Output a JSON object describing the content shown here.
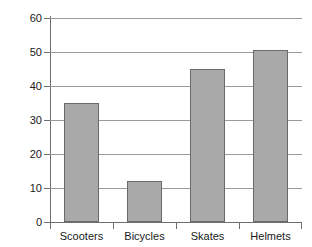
{
  "chart_data": {
    "type": "bar",
    "title": "",
    "subtitle": "",
    "xlabel": "",
    "ylabel": "",
    "categories": [
      "Scooters",
      "Bicycles",
      "Skates",
      "Helmets"
    ],
    "values": [
      35,
      12,
      45,
      50.5
    ],
    "ylim": [
      0,
      60
    ],
    "yticks": [
      0,
      10,
      20,
      30,
      40,
      50,
      60
    ],
    "ytick_labels": [
      "0",
      "10",
      "20",
      "30",
      "40",
      "50",
      "60"
    ],
    "grid": true,
    "grid_axis": "y",
    "legend": false,
    "legend_position": "none",
    "bar_fill_color": "#a9a9a9",
    "bar_edge_color": "#6a6a6a",
    "axis_color": "#6e6e6e",
    "gridline_color": "#9a9a9a",
    "background_color": "#ffffff",
    "text_color": "#1a1a1a"
  }
}
